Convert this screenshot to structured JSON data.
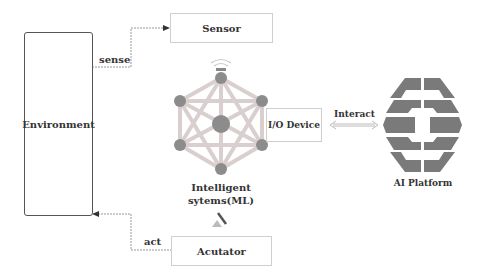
{
  "nodes": {
    "environment": "Environment",
    "sensor": "Sensor",
    "actuator": "Acutator",
    "io_device": "I/O Device",
    "intelligent_system_line1": "Intelligent",
    "intelligent_system_line2": "sytems(ML)",
    "ai_platform": "AI Platform"
  },
  "edges": {
    "sense": "sense",
    "act": "act",
    "interact": "Interact"
  },
  "colors": {
    "node_fill": "#8c8c8c",
    "edge_line": "#d0d0d0",
    "logo": "#7a7a7a"
  }
}
